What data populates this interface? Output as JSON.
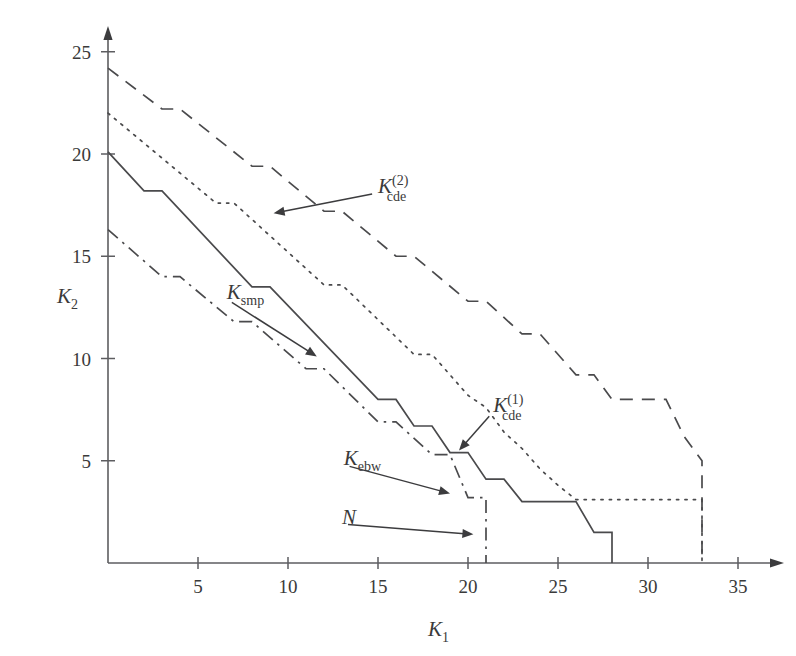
{
  "chart_data": {
    "type": "line",
    "title": "",
    "xlabel": "K1",
    "ylabel": "K2",
    "xlim": [
      0,
      36.5
    ],
    "ylim": [
      0,
      26
    ],
    "grid": false,
    "legend": "inline-annotations",
    "xticks": [
      5,
      10,
      15,
      20,
      25,
      30,
      35
    ],
    "yticks": [
      5,
      10,
      15,
      20,
      25
    ],
    "xtick_labels": [
      "5",
      "10",
      "15",
      "20",
      "25",
      "30",
      "35"
    ],
    "ytick_labels": [
      "5",
      "10",
      "15",
      "20",
      "25"
    ],
    "series": [
      {
        "name": "K_cde^(2)",
        "label_main": "K",
        "label_sub": "cde",
        "label_sup": "(2)",
        "style": "dashed",
        "points": [
          [
            0,
            24.2
          ],
          [
            3,
            22.2
          ],
          [
            4,
            22.2
          ],
          [
            8,
            19.4
          ],
          [
            9,
            19.4
          ],
          [
            12,
            17.2
          ],
          [
            13,
            17.2
          ],
          [
            16,
            15.0
          ],
          [
            17,
            15.0
          ],
          [
            20,
            12.8
          ],
          [
            21,
            12.8
          ],
          [
            23,
            11.2
          ],
          [
            24,
            11.2
          ],
          [
            26,
            9.2
          ],
          [
            27,
            9.2
          ],
          [
            28,
            8.0
          ],
          [
            31,
            8.0
          ],
          [
            32,
            6.2
          ],
          [
            33,
            5.0
          ],
          [
            33,
            0.0
          ]
        ]
      },
      {
        "name": "K_cde^(1)",
        "label_main": "K",
        "label_sub": "cde",
        "label_sup": "(1)",
        "style": "dotted",
        "points": [
          [
            0,
            22.0
          ],
          [
            6,
            17.6
          ],
          [
            7,
            17.6
          ],
          [
            12,
            13.6
          ],
          [
            13,
            13.6
          ],
          [
            17,
            10.2
          ],
          [
            18,
            10.2
          ],
          [
            20,
            8.2
          ],
          [
            21,
            7.6
          ],
          [
            22,
            6.4
          ],
          [
            23,
            5.6
          ],
          [
            24,
            4.6
          ],
          [
            25,
            3.8
          ],
          [
            26,
            3.1
          ],
          [
            33,
            3.1
          ],
          [
            33,
            1.4
          ],
          [
            33,
            0.0
          ]
        ]
      },
      {
        "name": "K_smp",
        "label_main": "K",
        "label_sub": "smp",
        "label_sup": "",
        "style": "solid",
        "points": [
          [
            0,
            20.1
          ],
          [
            2,
            18.2
          ],
          [
            3,
            18.2
          ],
          [
            8,
            13.5
          ],
          [
            9,
            13.5
          ],
          [
            15,
            8.0
          ],
          [
            16,
            8.0
          ],
          [
            17,
            6.7
          ],
          [
            18,
            6.7
          ],
          [
            19,
            5.4
          ],
          [
            20,
            5.4
          ],
          [
            21,
            4.1
          ],
          [
            22,
            4.1
          ],
          [
            23,
            3.0
          ],
          [
            26,
            3.0
          ],
          [
            27,
            1.5
          ],
          [
            28,
            1.5
          ],
          [
            28,
            0.0
          ]
        ]
      },
      {
        "name": "K_ebw",
        "label_main": "K",
        "label_sub": "ebw",
        "label_sup": "",
        "style": "dashdot",
        "points": [
          [
            0,
            16.3
          ],
          [
            3,
            14.0
          ],
          [
            4,
            14.0
          ],
          [
            7,
            11.8
          ],
          [
            8,
            11.8
          ],
          [
            11,
            9.5
          ],
          [
            12,
            9.5
          ],
          [
            15,
            6.9
          ],
          [
            16,
            6.9
          ],
          [
            18,
            5.3
          ],
          [
            19,
            5.3
          ],
          [
            20,
            3.2
          ],
          [
            21,
            3.2
          ],
          [
            21,
            0.0
          ]
        ]
      }
    ],
    "annotations": [
      {
        "name": "K_cde^(2)",
        "text_main": "K",
        "text_sub": "cde",
        "text_sup": "(2)",
        "label_pos": [
          15.0,
          18.1
        ],
        "arrow_to": [
          9.2,
          17.1
        ]
      },
      {
        "name": "K_cde^(1)",
        "text_main": "K",
        "text_sub": "cde",
        "text_sup": "(1)",
        "label_pos": [
          21.4,
          7.4
        ],
        "arrow_to": [
          19.5,
          5.5
        ]
      },
      {
        "name": "K_smp",
        "text_main": "K",
        "text_sub": "smp",
        "text_sup": "",
        "label_pos": [
          6.6,
          12.9
        ],
        "arrow_to": [
          11.6,
          10.1
        ]
      },
      {
        "name": "K_ebw",
        "text_main": "K",
        "text_sub": "ebw",
        "text_sup": "",
        "label_pos": [
          13.1,
          4.8
        ],
        "arrow_to": [
          19.0,
          3.4
        ]
      },
      {
        "name": "N",
        "text_main": "N",
        "text_sub": "",
        "text_sup": "",
        "label_pos": [
          13.0,
          1.9
        ],
        "arrow_to": [
          20.3,
          1.4
        ]
      }
    ]
  },
  "axes": {
    "x_name_main": "K",
    "x_name_sub": "1",
    "y_name_main": "K",
    "y_name_sub": "2"
  }
}
